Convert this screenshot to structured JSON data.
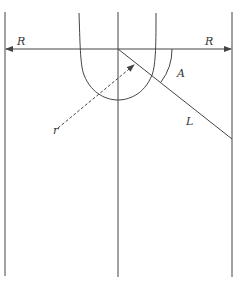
{
  "diagram": {
    "labels": {
      "radius_left": "R",
      "radius_right": "R",
      "angle": "A",
      "length": "L",
      "small_radius": "r"
    },
    "colors": {
      "stroke": "#444444",
      "background": "#ffffff"
    },
    "elements": [
      "left-wall-line",
      "center-axis-line",
      "right-wall-line",
      "horizontal-radius-arrow",
      "u-shaped-curve",
      "diagonal-line-L",
      "angle-arc-A",
      "dashed-radius-arrow-r"
    ]
  }
}
